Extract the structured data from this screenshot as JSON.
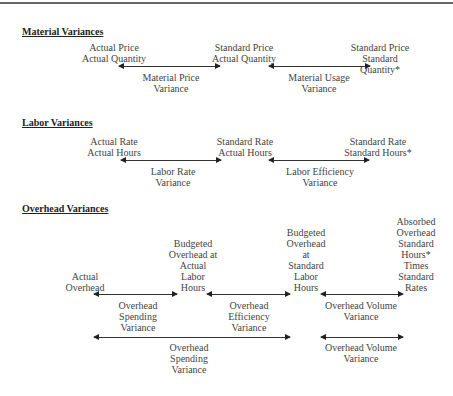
{
  "material": {
    "heading": "Material Variances",
    "col1": "Actual Price\nActual Quantity",
    "col2": "Standard Price\nActual Quantity",
    "col3": "Standard Price\nStandard Quantity*",
    "var1": "Material Price\nVariance",
    "var2": "Material Usage\nVariance"
  },
  "labor": {
    "heading": "Labor Variances",
    "col1": "Actual Rate\nActual Hours",
    "col2": "Standard Rate\nActual Hours",
    "col3": "Standard Rate\nStandard Hours*",
    "var1": "Labor Rate\nVariance",
    "var2": "Labor Efficiency\nVariance"
  },
  "overhead": {
    "heading": "Overhead Variances",
    "col1": "Actual\nOverhead",
    "col2": "Budgeted\nOverhead at\nActual\nLabor\nHours",
    "col3": "Budgeted\nOverhead\nat\nStandard\nLabor\nHours",
    "col4": "Absorbed\nOverhead\nStandard\nHours*\nTimes\nStandard\nRates",
    "var1": "Overhead\nSpending\nVariance",
    "var2": "Overhead\nEfficiency\nVariance",
    "var3": "Overhead Volume\nVariance",
    "var4": "Overhead\nSpending\nVariance",
    "var5": "Overhead Volume\nVariance"
  }
}
